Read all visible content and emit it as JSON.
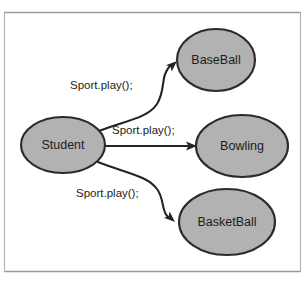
{
  "diagram": {
    "background_color": "#ffffff",
    "frame": {
      "border_color": "#9a9a9a",
      "side_border_color": "#b5b5b5"
    },
    "style": {
      "node_fill": "#b2b2b2",
      "node_stroke": "#2b2b2b",
      "edge_stroke": "#232323",
      "text_color": "#1c1c1c"
    },
    "nodes": [
      {
        "id": "student",
        "label": "Student",
        "shape": "ellipse",
        "cx": 63,
        "cy": 145,
        "rx": 42,
        "ry": 28
      },
      {
        "id": "baseball",
        "label": "BaseBall",
        "shape": "ellipse",
        "cx": 216,
        "cy": 60,
        "rx": 39,
        "ry": 31
      },
      {
        "id": "bowling",
        "label": "Bowling",
        "shape": "ellipse",
        "cx": 242,
        "cy": 146,
        "rx": 46,
        "ry": 31
      },
      {
        "id": "basketball",
        "label": "BasketBall",
        "shape": "ellipse",
        "cx": 227,
        "cy": 222,
        "rx": 48,
        "ry": 33
      }
    ],
    "edges": [
      {
        "id": "student-to-baseball",
        "from": "student",
        "to": "baseball",
        "label": "Sport.play();",
        "label_x": 70,
        "label_y": 86,
        "curve": "M 99,131 C 125,121 148,118 157,104 C 166,90 160,76 170,66",
        "arrow_x": 177,
        "arrow_y": 61,
        "arrow_angle": -42
      },
      {
        "id": "student-to-bowling",
        "from": "student",
        "to": "bowling",
        "label": "Sport.play();",
        "label_x": 112,
        "label_y": 131,
        "curve": "M 104,146 L 188,146",
        "arrow_x": 196,
        "arrow_y": 146,
        "arrow_angle": 0
      },
      {
        "id": "student-to-basketball",
        "from": "student",
        "to": "basketball",
        "label": "Sport.play();",
        "label_x": 76,
        "label_y": 194,
        "curve": "M 98,162 C 126,173 148,176 157,189 C 165,200 161,211 168,217",
        "arrow_x": 175,
        "arrow_y": 222,
        "arrow_angle": 42
      }
    ]
  }
}
